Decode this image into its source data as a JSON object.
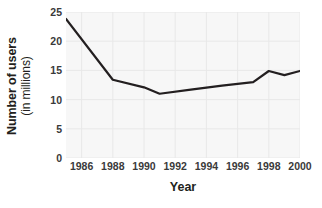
{
  "chart_data": {
    "type": "line",
    "title": "",
    "subtitle": "",
    "xlabel": "Year",
    "ylabel": "Number of users (in millions)",
    "ylabel_line1": "Number of users",
    "ylabel_line2": "(in millions)",
    "xlim": [
      1985,
      2000
    ],
    "ylim": [
      0,
      25
    ],
    "y_ticks": [
      0,
      5,
      10,
      15,
      20,
      25
    ],
    "y_tick_labels": [
      "0",
      "5",
      "10",
      "15",
      "20",
      "25"
    ],
    "x_ticks": [
      1986,
      1988,
      1990,
      1992,
      1994,
      1996,
      1998,
      2000
    ],
    "x_tick_labels": [
      "1986",
      "1988",
      "1990",
      "1992",
      "1994",
      "1996",
      "1998",
      "2000"
    ],
    "grid": true,
    "grid_color": "#e8e8e8",
    "plot_background": "#f7f7f7",
    "line_color": "#231f20",
    "line_width": 2.2,
    "legend": null,
    "legend_position": "none",
    "x": [
      1985,
      1988,
      1990,
      1991,
      1993,
      1995,
      1997,
      1998,
      1999,
      2000
    ],
    "values": [
      23.8,
      13.4,
      12.1,
      11.0,
      11.7,
      12.4,
      13.0,
      14.9,
      14.2,
      14.9
    ],
    "series": [
      {
        "name": "Number of users",
        "points": [
          {
            "x": 1985,
            "y": 23.8
          },
          {
            "x": 1988,
            "y": 13.4
          },
          {
            "x": 1990,
            "y": 12.1
          },
          {
            "x": 1991,
            "y": 11.0
          },
          {
            "x": 1993,
            "y": 11.7
          },
          {
            "x": 1995,
            "y": 12.4
          },
          {
            "x": 1997,
            "y": 13.0
          },
          {
            "x": 1998,
            "y": 14.9
          },
          {
            "x": 1999,
            "y": 14.2
          },
          {
            "x": 2000,
            "y": 14.9
          }
        ]
      }
    ],
    "annotations": []
  },
  "axis": {
    "x_title": "Year",
    "y_title_line1": "Number of users",
    "y_title_line2": "(in millions)"
  }
}
